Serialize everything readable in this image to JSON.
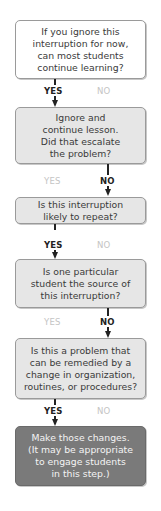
{
  "flowchart": {
    "nodes": [
      {
        "id": "q1",
        "style": "white",
        "lines": [
          "If you ignore this",
          "interruption for now,",
          "can most students",
          "continue learning?"
        ]
      },
      {
        "id": "q2",
        "style": "gray",
        "lines": [
          "Ignore and",
          "continue lesson.",
          "Did that escalate",
          "the problem?"
        ]
      },
      {
        "id": "q3",
        "style": "gray",
        "lines": [
          "Is this interruption",
          "likely to repeat?"
        ]
      },
      {
        "id": "q4",
        "style": "gray",
        "lines": [
          "Is one particular",
          "student the source of",
          "this interruption?"
        ]
      },
      {
        "id": "q5",
        "style": "gray",
        "lines": [
          "Is this a problem that",
          "can be remedied by a",
          "change in organization,",
          "routines, or procedures?"
        ]
      },
      {
        "id": "action",
        "style": "dark",
        "lines": [
          "Make those changes.",
          "(It may be appropriate",
          "to engage students",
          "in this step.)"
        ]
      }
    ],
    "branches": [
      {
        "from": "q1",
        "yes": "YES",
        "no": "NO",
        "taken": "yes"
      },
      {
        "from": "q2",
        "yes": "YES",
        "no": "NO",
        "taken": "no"
      },
      {
        "from": "q3",
        "yes": "YES",
        "no": "NO",
        "taken": "yes"
      },
      {
        "from": "q4",
        "yes": "YES",
        "no": "NO",
        "taken": "no"
      },
      {
        "from": "q5",
        "yes": "YES",
        "no": "NO",
        "taken": "yes"
      }
    ]
  },
  "colors": {
    "box_white": "#ffffff",
    "box_gray": "#e6e6e6",
    "box_dark": "#7a7a7a",
    "active_label": "#222222",
    "inactive_label": "#c4c4c4"
  }
}
